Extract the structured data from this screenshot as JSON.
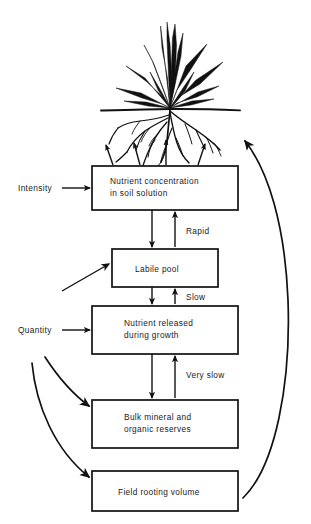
{
  "figure": {
    "boxes": [
      {
        "id": "nutrient-concentration",
        "lines": [
          "Nutrient concentration",
          "in soil solution"
        ],
        "x": 92,
        "y": 166,
        "w": 146,
        "h": 44
      },
      {
        "id": "labile-pool",
        "lines": [
          "Labile pool"
        ],
        "x": 112,
        "y": 249,
        "w": 106,
        "h": 38
      },
      {
        "id": "nutrient-released",
        "lines": [
          "Nutrient released",
          "during growth"
        ],
        "x": 92,
        "y": 306,
        "w": 146,
        "h": 48
      },
      {
        "id": "bulk-mineral",
        "lines": [
          "Bulk mineral and",
          "organic reserves"
        ],
        "x": 92,
        "y": 400,
        "w": 146,
        "h": 48
      },
      {
        "id": "field-rooting-volume",
        "lines": [
          "Field rooting volume"
        ],
        "x": 92,
        "y": 471,
        "w": 146,
        "h": 40
      }
    ],
    "side_labels": [
      {
        "id": "intensity",
        "text": "Intensity",
        "x": 18,
        "y": 191
      },
      {
        "id": "quantity",
        "text": "Quantity",
        "x": 18,
        "y": 333
      }
    ],
    "rate_labels": [
      {
        "id": "rapid",
        "text": "Rapid",
        "x": 186,
        "y": 234
      },
      {
        "id": "slow",
        "text": "Slow",
        "x": 186,
        "y": 300
      },
      {
        "id": "very-slow",
        "text": "Very slow",
        "x": 186,
        "y": 378
      }
    ],
    "colors": {
      "ink": "#111111",
      "text": "#1a1a1a",
      "background": "#ffffff"
    }
  }
}
